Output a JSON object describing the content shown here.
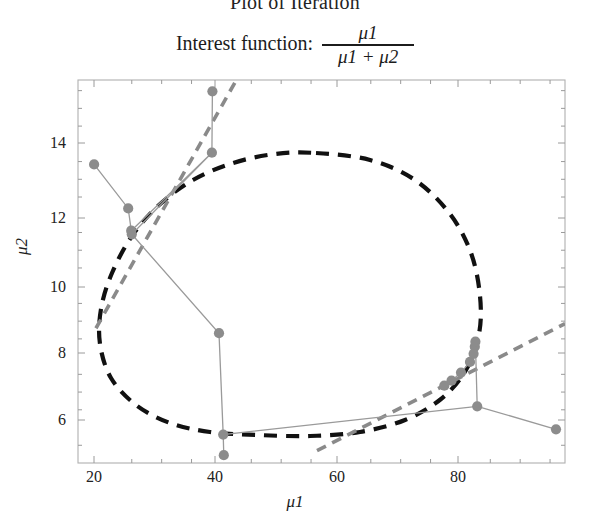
{
  "figure": {
    "title": "Plot of Iteration",
    "subtitle_prefix": "Interest function:",
    "formula_numerator": "μ1",
    "formula_denominator": "μ1 + μ2"
  },
  "chart_data": {
    "type": "scatter",
    "title": "Plot of Iteration",
    "subtitle": "Interest function: μ1 / (μ1 + μ2)",
    "xlabel": "μ1",
    "ylabel": "μ2",
    "xlim": [
      16.0,
      97.5
    ],
    "ylim": [
      5.0,
      15.8
    ],
    "xticks": [
      20,
      40,
      60,
      80
    ],
    "yticks": [
      6,
      8,
      10,
      12,
      14
    ],
    "xtick_labels": [
      "20",
      "40",
      "60",
      "80"
    ],
    "ytick_labels": [
      "6",
      "8",
      "10",
      "12",
      "14"
    ],
    "minor_ticks": true,
    "grid": false,
    "legend": "none",
    "frame": "box",
    "marker_color": "#8c8c8c",
    "path_color": "#9a9a9a",
    "contour_color": "#111111",
    "tangent_color": "#8a8a8a",
    "series": [
      {
        "name": "iteration-path",
        "type": "scatter-with-path",
        "points": [
          {
            "x": 18.7,
            "y": 13.42
          },
          {
            "x": 24.4,
            "y": 12.18
          },
          {
            "x": 24.9,
            "y": 11.55
          },
          {
            "x": 25.0,
            "y": 11.45
          },
          {
            "x": 38.4,
            "y": 13.75
          },
          {
            "x": 38.5,
            "y": 15.48
          },
          {
            "x": 39.6,
            "y": 8.66
          },
          {
            "x": 40.3,
            "y": 5.8
          },
          {
            "x": 40.4,
            "y": 5.22
          },
          {
            "x": 77.3,
            "y": 7.18
          },
          {
            "x": 78.5,
            "y": 7.32
          },
          {
            "x": 80.1,
            "y": 7.55
          },
          {
            "x": 81.6,
            "y": 7.85
          },
          {
            "x": 82.2,
            "y": 8.08
          },
          {
            "x": 82.4,
            "y": 8.28
          },
          {
            "x": 82.5,
            "y": 8.42
          },
          {
            "x": 82.8,
            "y": 6.6
          },
          {
            "x": 96.0,
            "y": 5.95
          }
        ]
      },
      {
        "name": "constraint-contour",
        "type": "closed-curve-dashed",
        "description": "dashed black closed oval contour"
      },
      {
        "name": "tangent-line-left",
        "type": "line-dashed",
        "x": [
          19.0,
          42.5
        ],
        "y": [
          8.8,
          15.8
        ]
      },
      {
        "name": "tangent-line-right",
        "type": "line-dashed",
        "x": [
          56.0,
          97.5
        ],
        "y": [
          5.35,
          8.93
        ]
      }
    ]
  },
  "axes": {
    "x_ticks": [
      {
        "label": "20",
        "px": 94
      },
      {
        "label": "40",
        "px": 215
      },
      {
        "label": "60",
        "px": 337
      },
      {
        "label": "80",
        "px": 458
      }
    ],
    "y_ticks": [
      {
        "label": "6",
        "px": 420
      },
      {
        "label": "8",
        "px": 353
      },
      {
        "label": "10",
        "px": 287
      },
      {
        "label": "12",
        "px": 218
      },
      {
        "label": "14",
        "px": 143
      }
    ]
  }
}
